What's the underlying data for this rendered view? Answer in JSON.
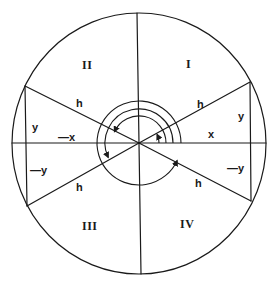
{
  "diagram": {
    "colors": {
      "stroke": "#1a1a1a",
      "background": "#ffffff"
    },
    "quadrants": {
      "q1": "I",
      "q2": "II",
      "q3": "III",
      "q4": "IV"
    },
    "triangles": {
      "q1": {
        "hyp": "h",
        "adjacent": "x",
        "opposite": "y"
      },
      "q2": {
        "hyp": "h",
        "adjacent": "—x",
        "opposite": "y"
      },
      "q3": {
        "hyp": "h",
        "opposite": "—y"
      },
      "q4": {
        "hyp": "h",
        "opposite": "—y"
      }
    },
    "angle_arcs": [
      {
        "quadrant": "I",
        "end_deg": 25
      },
      {
        "quadrant": "II",
        "end_deg": 155
      },
      {
        "quadrant": "III",
        "end_deg": 205
      },
      {
        "quadrant": "IV",
        "end_deg": 335
      }
    ]
  }
}
